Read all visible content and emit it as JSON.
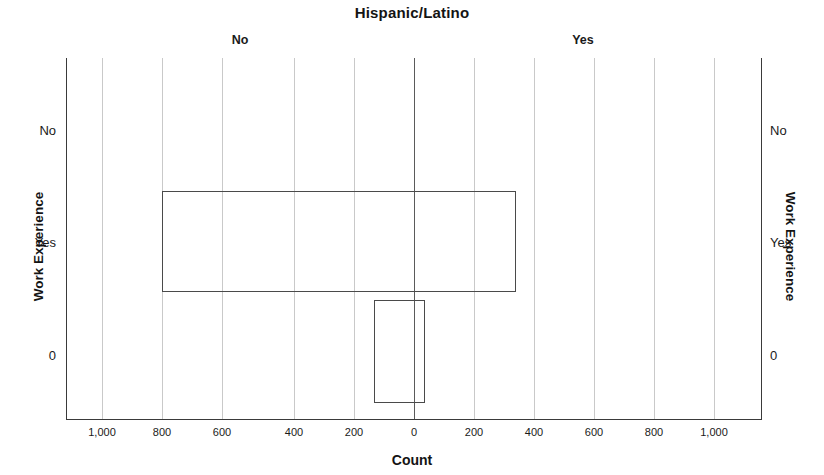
{
  "chart_data": {
    "type": "bar",
    "title": "Hispanic/Latino",
    "subtitle": "",
    "xlabel": "Count",
    "ylabel": "Work Experience",
    "ylabel_right": "Work Experience",
    "orientation": "horizontal",
    "layout": "back-to-back population pyramid",
    "grid": true,
    "legend": "none",
    "column_headers": [
      "No",
      "Yes"
    ],
    "categories": [
      "No",
      "Yes",
      "0"
    ],
    "xlim": [
      -1100,
      1100
    ],
    "xticks": [
      -1000,
      -800,
      -600,
      -400,
      -200,
      0,
      200,
      400,
      600,
      800,
      1000
    ],
    "xticklabels": [
      "1,000",
      "800",
      "600",
      "400",
      "200",
      "0",
      "200",
      "400",
      "600",
      "800",
      "1,000"
    ],
    "series": [
      {
        "name": "No",
        "values": [
          0,
          840,
          133
        ]
      },
      {
        "name": "Yes",
        "values": [
          0,
          340,
          37
        ]
      }
    ],
    "bars": [
      {
        "category": "No",
        "left_value": 0,
        "right_value": 0,
        "visible": false
      },
      {
        "category": "Yes",
        "left_value": 840,
        "right_value": 340,
        "visible": true
      },
      {
        "category": "0",
        "left_value": 133,
        "right_value": 37,
        "visible": true
      }
    ],
    "colors": {
      "bar_outline": "#4a4a4a",
      "bar_fill": "transparent",
      "gridline": "#c9c9c9",
      "zero_line": "#5a5a5a",
      "axis": "#3a3a3a",
      "text": "#1a1a1a",
      "background": "#ffffff"
    }
  },
  "axes": {
    "x_ticks": [
      {
        "label": "1,000",
        "x": 102
      },
      {
        "label": "800",
        "x": 162
      },
      {
        "label": "600",
        "x": 222
      },
      {
        "label": "400",
        "x": 294
      },
      {
        "label": "200",
        "x": 354
      },
      {
        "label": "0",
        "x": 414
      },
      {
        "label": "200",
        "x": 474
      },
      {
        "label": "400",
        "x": 534
      },
      {
        "label": "600",
        "x": 594
      },
      {
        "label": "800",
        "x": 654
      },
      {
        "label": "1,000",
        "x": 714
      }
    ],
    "y_ticks": [
      {
        "label": "No",
        "y": 130
      },
      {
        "label": "Yes",
        "y": 242
      },
      {
        "label": "0",
        "y": 355
      }
    ]
  },
  "header": {
    "left_group": "No",
    "right_group": "Yes"
  }
}
